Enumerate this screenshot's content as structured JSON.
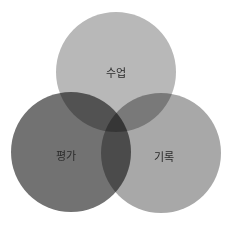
{
  "diagram": {
    "type": "venn",
    "sets": [
      {
        "id": "class",
        "label": "수업",
        "cx": 116,
        "cy": 72,
        "r": 60,
        "color": "#b8b8b8",
        "label_x": 116,
        "label_y": 72
      },
      {
        "id": "evaluation",
        "label": "평가",
        "cx": 71,
        "cy": 152,
        "r": 60,
        "color": "#727272",
        "label_x": 66,
        "label_y": 155
      },
      {
        "id": "record",
        "label": "기록",
        "cx": 161,
        "cy": 153,
        "r": 60,
        "color": "#a8a8a8",
        "label_x": 164,
        "label_y": 156
      }
    ],
    "background": "#ffffff"
  }
}
